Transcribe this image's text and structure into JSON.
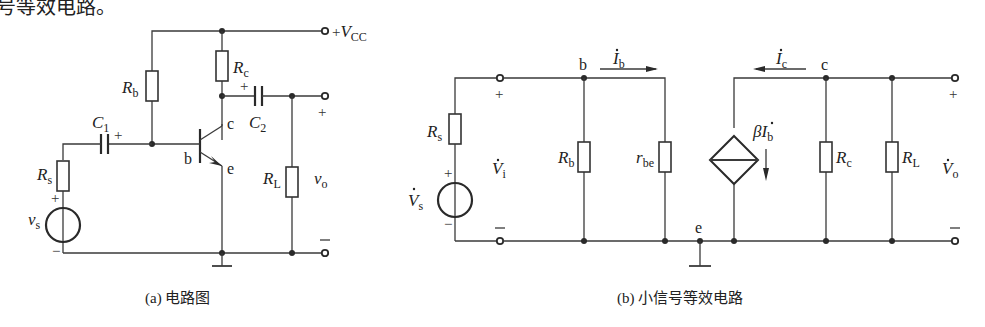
{
  "header_fragment": "号等效电路。",
  "figure_a": {
    "caption": "(a) 电路图",
    "supply_label": "+V",
    "supply_sub": "CC",
    "components": {
      "Rb": {
        "main": "R",
        "sub": "b"
      },
      "Rc": {
        "main": "R",
        "sub": "c"
      },
      "Rs": {
        "main": "R",
        "sub": "s"
      },
      "RL": {
        "main": "R",
        "sub": "L"
      },
      "C1": {
        "main": "C",
        "sub": "1"
      },
      "C2": {
        "main": "C",
        "sub": "2"
      },
      "vs": {
        "main": "v",
        "sub": "s"
      },
      "vo": {
        "main": "v",
        "sub": "o"
      }
    },
    "nodes": {
      "b": "b",
      "c": "c",
      "e": "e"
    },
    "signs": {
      "plus": "+",
      "minus": "−"
    }
  },
  "figure_b": {
    "caption": "(b) 小信号等效电路",
    "components": {
      "Rs": {
        "main": "R",
        "sub": "s"
      },
      "Rb": {
        "main": "R",
        "sub": "b"
      },
      "rbe": {
        "main": "r",
        "sub": "be"
      },
      "Rc": {
        "main": "R",
        "sub": "c"
      },
      "RL": {
        "main": "R",
        "sub": "L"
      },
      "Vs": {
        "main": "V",
        "sub": "s"
      },
      "Vi": {
        "main": "V",
        "sub": "i"
      },
      "Vo": {
        "main": "V",
        "sub": "o"
      },
      "Ib": {
        "main": "I",
        "sub": "b"
      },
      "Ic": {
        "main": "I",
        "sub": "c"
      },
      "source": {
        "main": "βI",
        "sub": "b"
      }
    },
    "nodes": {
      "b": "b",
      "c": "c",
      "e": "e"
    },
    "signs": {
      "plus": "+",
      "minus": "−"
    }
  }
}
